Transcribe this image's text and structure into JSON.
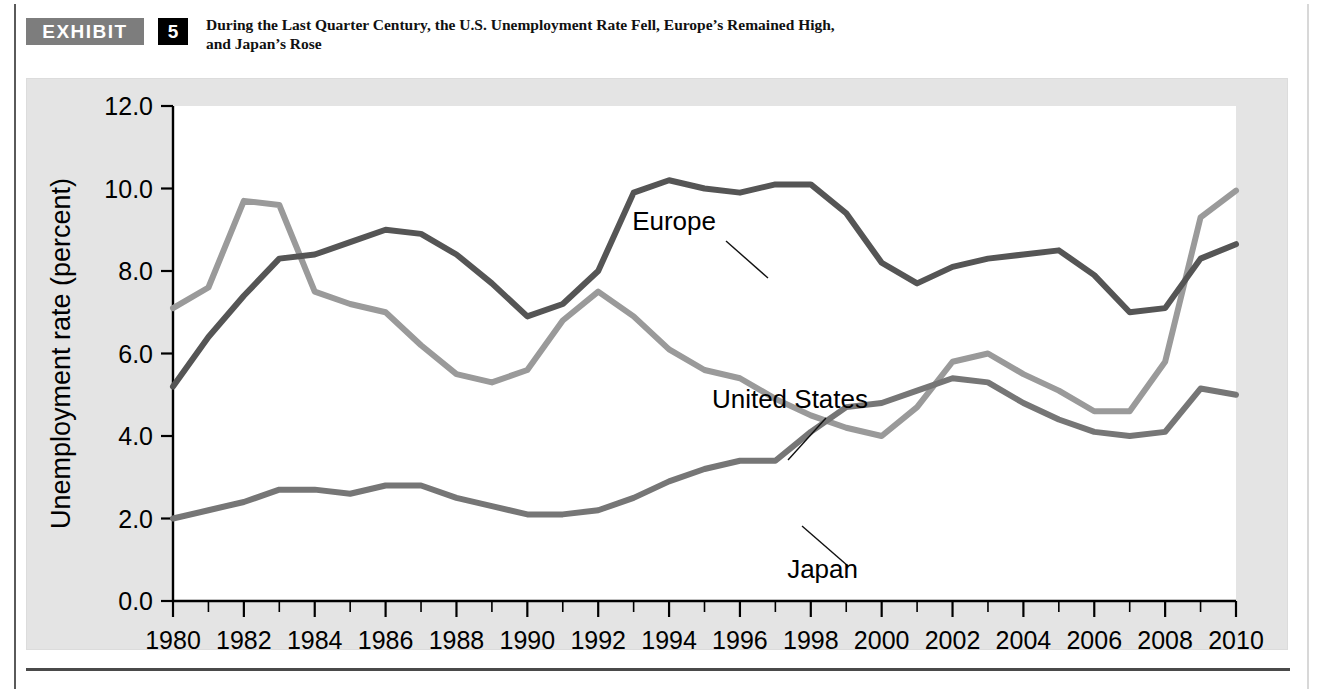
{
  "header": {
    "exhibit_tag": "EXHIBIT",
    "exhibit_number": "5",
    "title_line1": "During the Last Quarter Century, the U.S. Unemployment Rate Fell, Europe’s Remained High,",
    "title_line2": "and Japan’s Rose"
  },
  "colors": {
    "exhibit_tag_bg": "#7d7d7d",
    "exhibit_number_bg": "#000000",
    "panel_bg": "#e4e4e4",
    "plot_bg": "#ffffff",
    "united_states": "#9a9a9a",
    "europe": "#555555",
    "japan": "#767676",
    "axis": "#000000"
  },
  "chart_data": {
    "type": "line",
    "title": "During the Last Quarter Century, the U.S. Unemployment Rate Fell, Europe’s Remained High, and Japan’s Rose",
    "xlabel": "",
    "ylabel": "Unemployment rate (percent)",
    "xlim": [
      1980,
      2010
    ],
    "ylim": [
      0.0,
      12.0
    ],
    "grid": false,
    "legend_position": "inline-annotations",
    "y_ticks": [
      "0.0",
      "2.0",
      "4.0",
      "6.0",
      "8.0",
      "10.0",
      "12.0"
    ],
    "y_tick_values": [
      0.0,
      2.0,
      4.0,
      6.0,
      8.0,
      10.0,
      12.0
    ],
    "x_ticks": [
      "1980",
      "1982",
      "1984",
      "1986",
      "1988",
      "1990",
      "1992",
      "1994",
      "1996",
      "1998",
      "2000",
      "2002",
      "2004",
      "2006",
      "2008",
      "2010"
    ],
    "x_tick_values": [
      1980,
      1982,
      1984,
      1986,
      1988,
      1990,
      1992,
      1994,
      1996,
      1998,
      2000,
      2002,
      2004,
      2006,
      2008,
      2010
    ],
    "x": [
      1980,
      1981,
      1982,
      1983,
      1984,
      1985,
      1986,
      1987,
      1988,
      1989,
      1990,
      1991,
      1992,
      1993,
      1994,
      1995,
      1996,
      1997,
      1998,
      1999,
      2000,
      2001,
      2002,
      2003,
      2004,
      2005,
      2006,
      2007,
      2008,
      2009,
      2010
    ],
    "series": [
      {
        "name": "United States",
        "color": "#9a9a9a",
        "values": [
          7.1,
          7.6,
          9.7,
          9.6,
          7.5,
          7.2,
          7.0,
          6.2,
          5.5,
          5.3,
          5.6,
          6.8,
          7.5,
          6.9,
          6.1,
          5.6,
          5.4,
          4.9,
          4.5,
          4.2,
          4.0,
          4.7,
          5.8,
          6.0,
          5.5,
          5.1,
          4.6,
          4.6,
          5.8,
          9.3,
          9.95
        ]
      },
      {
        "name": "Europe",
        "color": "#555555",
        "values": [
          5.2,
          6.4,
          7.4,
          8.3,
          8.4,
          8.7,
          9.0,
          8.9,
          8.4,
          7.7,
          6.9,
          7.2,
          8.0,
          9.9,
          10.2,
          10.0,
          9.9,
          10.1,
          10.1,
          9.4,
          8.2,
          7.7,
          8.1,
          8.3,
          8.4,
          8.5,
          7.9,
          7.0,
          7.1,
          8.3,
          8.65
        ]
      },
      {
        "name": "Japan",
        "color": "#767676",
        "values": [
          2.0,
          2.2,
          2.4,
          2.7,
          2.7,
          2.6,
          2.8,
          2.8,
          2.5,
          2.3,
          2.1,
          2.1,
          2.2,
          2.5,
          2.9,
          3.2,
          3.4,
          3.4,
          4.1,
          4.7,
          4.8,
          5.1,
          5.4,
          5.3,
          4.8,
          4.4,
          4.1,
          4.0,
          4.1,
          5.15,
          5.0
        ]
      }
    ],
    "annotations": [
      {
        "label": "Europe",
        "points_to_year": 1994,
        "points_to_value": 10.0
      },
      {
        "label": "United States",
        "points_to_year": 1996,
        "points_to_value": 5.4
      },
      {
        "label": "Japan",
        "points_to_year": 1996,
        "points_to_value": 3.4
      }
    ]
  }
}
